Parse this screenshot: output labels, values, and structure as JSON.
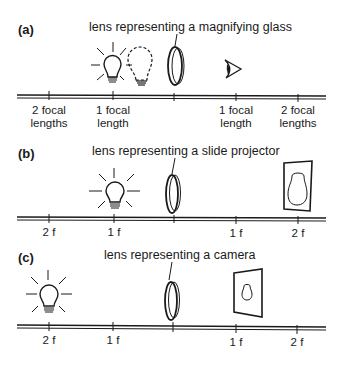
{
  "diagram": {
    "colors": {
      "ink": "#1a1a1a",
      "background": "#ffffff"
    },
    "panels": [
      {
        "id": "a",
        "label": "(a)",
        "caption": "lens representing a magnifying glass",
        "tick_labels": [
          "2 focal\nlengths",
          "1 focal\nlength",
          "",
          "1 focal\nlength",
          "2 focal\nlengths"
        ],
        "objects": [
          "lit-bulb at 1 focal length (left, slightly inside)",
          "dashed virtual bulb image",
          "lens",
          "eye (viewer)"
        ]
      },
      {
        "id": "b",
        "label": "(b)",
        "caption": "lens representing a slide projector",
        "tick_labels": [
          "2 f",
          "1 f",
          "",
          "1 f",
          "2 f"
        ],
        "objects": [
          "lit-bulb at 1 f (left)",
          "lens",
          "enlarged inverted image on screen at 2 f (right)"
        ]
      },
      {
        "id": "c",
        "label": "(c)",
        "caption": "lens representing a camera",
        "tick_labels": [
          "2 f",
          "1 f",
          "",
          "1 f",
          "2 f"
        ],
        "objects": [
          "lit-bulb at 2 f (left)",
          "lens",
          "small inverted image on film between 1 f and 2 f (right)"
        ]
      }
    ]
  }
}
